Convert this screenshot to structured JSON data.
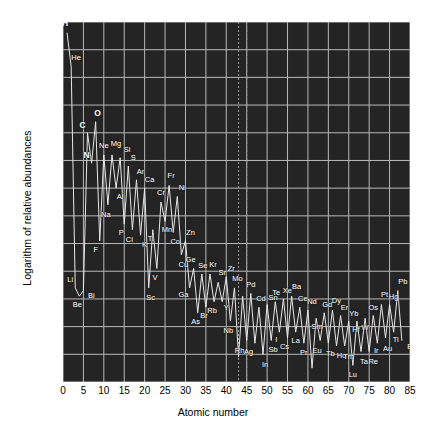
{
  "chart_data": {
    "type": "line",
    "title": "",
    "xlabel": "Atomic number",
    "ylabel": "Logarithm of relative abundances",
    "xlim": [
      0,
      85
    ],
    "ylim": [
      -4,
      9
    ],
    "xticks": [
      0,
      5,
      10,
      15,
      20,
      25,
      30,
      35,
      40,
      45,
      50,
      55,
      60,
      65,
      70,
      75,
      80,
      85
    ],
    "yticks": [
      -4,
      -3,
      -2,
      -1,
      0,
      1,
      2,
      3,
      4,
      5,
      6,
      7,
      8,
      9
    ],
    "grid": true,
    "legend": "none",
    "background_color": "#242424",
    "grid_color": "#b9b9b9",
    "line_color": "#e8e8e8",
    "label_color": "#ffffff",
    "annotations": [
      {
        "name": "unstable-element-marker",
        "x": 43,
        "note": "dashed vertical line at Tc"
      },
      {
        "name": "unstable-element-marker",
        "x": 45,
        "note": "dashed vertical line"
      }
    ],
    "x": [
      1,
      2,
      3,
      4,
      5,
      6,
      7,
      8,
      9,
      10,
      11,
      12,
      13,
      14,
      15,
      16,
      17,
      18,
      19,
      20,
      21,
      22,
      23,
      24,
      25,
      26,
      27,
      28,
      29,
      30,
      31,
      32,
      33,
      34,
      35,
      36,
      37,
      38,
      39,
      40,
      41,
      42,
      43,
      44,
      45,
      46,
      47,
      48,
      49,
      50,
      51,
      52,
      53,
      54,
      55,
      56,
      57,
      58,
      59,
      60,
      61,
      62,
      63,
      64,
      65,
      66,
      67,
      68,
      69,
      70,
      71,
      72,
      73,
      74,
      75,
      76,
      77,
      78,
      79,
      80,
      81,
      82,
      83
    ],
    "values": [
      8.6,
      7.4,
      -0.6,
      -0.9,
      -0.7,
      5.0,
      3.9,
      5.4,
      1.1,
      4.2,
      2.4,
      4.2,
      3.0,
      4.1,
      1.7,
      3.8,
      1.5,
      3.3,
      1.3,
      3.0,
      -0.6,
      1.5,
      0.1,
      2.5,
      1.8,
      3.1,
      1.4,
      2.7,
      0.6,
      1.1,
      -0.6,
      0.1,
      -1.5,
      -0.1,
      -1.3,
      -0.1,
      -1.1,
      -0.4,
      -1.1,
      -0.2,
      -1.8,
      -0.6,
      -3.1,
      -0.9,
      -2.5,
      -0.8,
      -2.6,
      -1.3,
      -3.0,
      -1.2,
      -2.5,
      -1.1,
      -2.2,
      -1.0,
      -2.4,
      -0.9,
      -2.2,
      -1.3,
      -2.6,
      -1.4,
      -3.5,
      -1.7,
      -2.5,
      -1.5,
      -2.6,
      -1.4,
      -2.7,
      -1.6,
      -2.7,
      -1.8,
      -3.4,
      -1.8,
      -2.9,
      -1.7,
      -2.9,
      -1.6,
      -2.6,
      -1.2,
      -2.4,
      -1.2,
      -2.2,
      -0.7,
      -2.5
    ],
    "points": [
      {
        "z": 1,
        "symbol": "H",
        "value": 8.6,
        "bold": true,
        "dx": -2,
        "dy": -10
      },
      {
        "z": 2,
        "symbol": "He",
        "value": 7.4,
        "bold": false,
        "dx": 5,
        "dy": -8
      },
      {
        "z": 3,
        "symbol": "Li",
        "value": -0.6,
        "bold": false,
        "dx": -5,
        "dy": -8
      },
      {
        "z": 4,
        "symbol": "Be",
        "value": -0.9,
        "bold": false,
        "dx": -2,
        "dy": 9
      },
      {
        "z": 5,
        "symbol": "Bi",
        "value": -0.7,
        "bold": false,
        "dx": 8,
        "dy": 5
      },
      {
        "z": 6,
        "symbol": "C",
        "value": 5.0,
        "bold": true,
        "dx": -5,
        "dy": -8
      },
      {
        "z": 7,
        "symbol": "N",
        "value": 3.9,
        "bold": true,
        "dx": -5,
        "dy": -8
      },
      {
        "z": 8,
        "symbol": "O",
        "value": 5.4,
        "bold": true,
        "dx": 2,
        "dy": -9
      },
      {
        "z": 9,
        "symbol": "F",
        "value": 1.1,
        "bold": false,
        "dx": -4,
        "dy": 9
      },
      {
        "z": 10,
        "symbol": "Ne",
        "value": 4.2,
        "bold": false,
        "dx": 0,
        "dy": -9
      },
      {
        "z": 11,
        "symbol": "Na",
        "value": 2.4,
        "bold": false,
        "dx": -2,
        "dy": 10
      },
      {
        "z": 12,
        "symbol": "Mg",
        "value": 4.2,
        "bold": false,
        "dx": 4,
        "dy": -11
      },
      {
        "z": 13,
        "symbol": "Al",
        "value": 3.0,
        "bold": false,
        "dx": 4,
        "dy": 9
      },
      {
        "z": 14,
        "symbol": "Si",
        "value": 4.1,
        "bold": false,
        "dx": 7,
        "dy": -8
      },
      {
        "z": 15,
        "symbol": "P",
        "value": 1.7,
        "bold": false,
        "dx": -3,
        "dy": 9
      },
      {
        "z": 16,
        "symbol": "S",
        "value": 3.8,
        "bold": false,
        "dx": 5,
        "dy": -8
      },
      {
        "z": 17,
        "symbol": "Cl",
        "value": 1.5,
        "bold": false,
        "dx": -3,
        "dy": 10
      },
      {
        "z": 18,
        "symbol": "Ar",
        "value": 3.3,
        "bold": false,
        "dx": 4,
        "dy": -8
      },
      {
        "z": 19,
        "symbol": "K",
        "value": 1.3,
        "bold": false,
        "dx": 4,
        "dy": 10
      },
      {
        "z": 20,
        "symbol": "Ca",
        "value": 3.0,
        "bold": false,
        "dx": 5,
        "dy": -8
      },
      {
        "z": 21,
        "symbol": "Sc",
        "value": -0.6,
        "bold": false,
        "dx": 2,
        "dy": 10
      },
      {
        "z": 22,
        "symbol": "Ti",
        "value": 1.5,
        "bold": false,
        "dx": -2,
        "dy": 9
      },
      {
        "z": 23,
        "symbol": "V",
        "value": 0.1,
        "bold": false,
        "dx": -2,
        "dy": 10
      },
      {
        "z": 24,
        "symbol": "Cr",
        "value": 2.5,
        "bold": false,
        "dx": 0,
        "dy": -9
      },
      {
        "z": 25,
        "symbol": "Mn",
        "value": 1.8,
        "bold": false,
        "dx": 2,
        "dy": 9
      },
      {
        "z": 26,
        "symbol": "Fr",
        "value": 3.1,
        "bold": false,
        "dx": 2,
        "dy": -9
      },
      {
        "z": 27,
        "symbol": "Co",
        "value": 1.4,
        "bold": false,
        "dx": 2,
        "dy": 10
      },
      {
        "z": 28,
        "symbol": "Ni",
        "value": 2.7,
        "bold": false,
        "dx": 5,
        "dy": -8
      },
      {
        "z": 29,
        "symbol": "Cu",
        "value": 0.6,
        "bold": false,
        "dx": 2,
        "dy": 10
      },
      {
        "z": 30,
        "symbol": "Zn",
        "value": 1.1,
        "bold": false,
        "dx": 5,
        "dy": -8
      },
      {
        "z": 31,
        "symbol": "Ga",
        "value": -0.6,
        "bold": false,
        "dx": -6,
        "dy": 7
      },
      {
        "z": 32,
        "symbol": "Ge",
        "value": 0.1,
        "bold": false,
        "dx": -3,
        "dy": -8
      },
      {
        "z": 33,
        "symbol": "As",
        "value": -1.5,
        "bold": false,
        "dx": -2,
        "dy": 9
      },
      {
        "z": 34,
        "symbol": "Se",
        "value": -0.1,
        "bold": false,
        "dx": 1,
        "dy": -8
      },
      {
        "z": 35,
        "symbol": "Br",
        "value": -1.3,
        "bold": false,
        "dx": -2,
        "dy": 9
      },
      {
        "z": 36,
        "symbol": "Kr",
        "value": -0.1,
        "bold": false,
        "dx": 3,
        "dy": -9
      },
      {
        "z": 37,
        "symbol": "Rb",
        "value": -1.1,
        "bold": false,
        "dx": -2,
        "dy": 9
      },
      {
        "z": 38,
        "symbol": "Sr",
        "value": -0.4,
        "bold": false,
        "dx": 4,
        "dy": -9
      },
      {
        "z": 39,
        "symbol": "Y",
        "value": -1.1,
        "bold": false,
        "dx": 4,
        "dy": 6
      },
      {
        "z": 40,
        "symbol": "Zr",
        "value": -0.2,
        "bold": false,
        "dx": 5,
        "dy": -8
      },
      {
        "z": 41,
        "symbol": "Nb",
        "value": -1.8,
        "bold": false,
        "dx": -2,
        "dy": 10
      },
      {
        "z": 42,
        "symbol": "Mo",
        "value": -0.6,
        "bold": false,
        "dx": 3,
        "dy": -9
      },
      {
        "z": 44,
        "symbol": "Rh",
        "value": -2.5,
        "bold": false,
        "dx": -3,
        "dy": 11
      },
      {
        "z": 45,
        "symbol": "Ag",
        "value": -2.6,
        "bold": false,
        "dx": 2,
        "dy": 9
      },
      {
        "z": 46,
        "symbol": "Pd",
        "value": -0.8,
        "bold": false,
        "dx": 0,
        "dy": -8
      },
      {
        "z": 48,
        "symbol": "Cd",
        "value": -1.3,
        "bold": false,
        "dx": 2,
        "dy": -8
      },
      {
        "z": 49,
        "symbol": "In",
        "value": -3.0,
        "bold": false,
        "dx": 2,
        "dy": 11
      },
      {
        "z": 50,
        "symbol": "Sn",
        "value": -1.2,
        "bold": false,
        "dx": 6,
        "dy": -6
      },
      {
        "z": 51,
        "symbol": "Sb",
        "value": -2.5,
        "bold": false,
        "dx": 2,
        "dy": 10
      },
      {
        "z": 52,
        "symbol": "Te",
        "value": -1.1,
        "bold": false,
        "dx": 1,
        "dy": -9
      },
      {
        "z": 53,
        "symbol": "I",
        "value": -2.2,
        "bold": false,
        "dx": -3,
        "dy": 8
      },
      {
        "z": 54,
        "symbol": "Xe",
        "value": -1.0,
        "bold": false,
        "dx": 4,
        "dy": -8
      },
      {
        "z": 55,
        "symbol": "Cs",
        "value": -2.4,
        "bold": false,
        "dx": -3,
        "dy": 9
      },
      {
        "z": 56,
        "symbol": "Ba",
        "value": -0.9,
        "bold": false,
        "dx": 5,
        "dy": -9
      },
      {
        "z": 57,
        "symbol": "La",
        "value": -2.2,
        "bold": false,
        "dx": 0,
        "dy": 9
      },
      {
        "z": 58,
        "symbol": "Ce",
        "value": -1.3,
        "bold": false,
        "dx": 3,
        "dy": -8
      },
      {
        "z": 59,
        "symbol": "Pr",
        "value": -2.6,
        "bold": false,
        "dx": 0,
        "dy": 10
      },
      {
        "z": 60,
        "symbol": "Nd",
        "value": -1.4,
        "bold": false,
        "dx": 4,
        "dy": -8
      },
      {
        "z": 62,
        "symbol": "Sm",
        "value": -1.7,
        "bold": false,
        "dx": 1,
        "dy": 9
      },
      {
        "z": 63,
        "symbol": "Eu",
        "value": -2.5,
        "bold": false,
        "dx": -3,
        "dy": 11
      },
      {
        "z": 64,
        "symbol": "Gd",
        "value": -1.5,
        "bold": false,
        "dx": 3,
        "dy": -8
      },
      {
        "z": 65,
        "symbol": "Tb",
        "value": -2.6,
        "bold": false,
        "dx": 2,
        "dy": 11
      },
      {
        "z": 66,
        "symbol": "Dy",
        "value": -1.4,
        "bold": false,
        "dx": 4,
        "dy": -9
      },
      {
        "z": 67,
        "symbol": "Ho",
        "value": -2.7,
        "bold": false,
        "dx": 5,
        "dy": 10
      },
      {
        "z": 68,
        "symbol": "Er",
        "value": -1.6,
        "bold": false,
        "dx": 4,
        "dy": -8
      },
      {
        "z": 69,
        "symbol": "Tm",
        "value": -2.7,
        "bold": false,
        "dx": 4,
        "dy": 11
      },
      {
        "z": 70,
        "symbol": "Yb",
        "value": -1.8,
        "bold": false,
        "dx": 5,
        "dy": -7
      },
      {
        "z": 71,
        "symbol": "Lu",
        "value": -3.4,
        "bold": false,
        "dx": 0,
        "dy": 10
      },
      {
        "z": 72,
        "symbol": "Hf",
        "value": -1.8,
        "bold": false,
        "dx": -1,
        "dy": 9
      },
      {
        "z": 73,
        "symbol": "Ta",
        "value": -2.9,
        "bold": false,
        "dx": 3,
        "dy": 10
      },
      {
        "z": 74,
        "symbol": "W",
        "value": -1.7,
        "bold": false,
        "dx": 0,
        "dy": 10
      },
      {
        "z": 75,
        "symbol": "Re",
        "value": -2.9,
        "bold": false,
        "dx": 4,
        "dy": 10
      },
      {
        "z": 76,
        "symbol": "Os",
        "value": -1.6,
        "bold": false,
        "dx": 0,
        "dy": -8
      },
      {
        "z": 77,
        "symbol": "Ir",
        "value": -2.6,
        "bold": false,
        "dx": -1,
        "dy": 8
      },
      {
        "z": 78,
        "symbol": "Pt",
        "value": -1.2,
        "bold": false,
        "dx": 3,
        "dy": -9
      },
      {
        "z": 79,
        "symbol": "Au",
        "value": -2.4,
        "bold": false,
        "dx": 2,
        "dy": 11
      },
      {
        "z": 80,
        "symbol": "Hg",
        "value": -1.2,
        "bold": false,
        "dx": 4,
        "dy": -7
      },
      {
        "z": 81,
        "symbol": "Ti",
        "value": -2.2,
        "bold": false,
        "dx": 2,
        "dy": 8
      },
      {
        "z": 82,
        "symbol": "Pb",
        "value": -0.7,
        "bold": false,
        "dx": 5,
        "dy": -9
      },
      {
        "z": 83,
        "symbol": "B",
        "value": -2.5,
        "bold": false,
        "dx": 8,
        "dy": 7
      }
    ]
  }
}
